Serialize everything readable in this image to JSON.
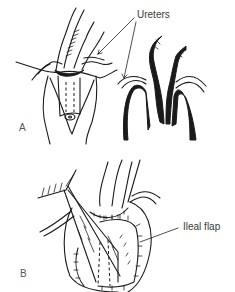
{
  "figure": {
    "panels": [
      {
        "id": "A",
        "letter": "A",
        "callouts": [
          {
            "text": "Ureters",
            "arrows": 2
          }
        ]
      },
      {
        "id": "B",
        "letter": "B",
        "callouts": [
          {
            "text": "Ileal flap",
            "arrows": 1
          }
        ]
      }
    ]
  },
  "labels": {
    "ureters": "Ureters",
    "ileal_flap": "Ileal flap",
    "panel_a": "A",
    "panel_b": "B"
  },
  "colors": {
    "line": "#1a1a1a",
    "background": "#ffffff",
    "text": "#3a3a3a"
  }
}
